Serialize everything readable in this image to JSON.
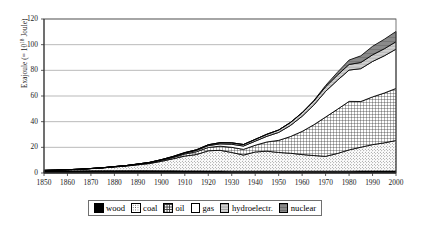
{
  "chart_data": {
    "type": "area",
    "stacked": true,
    "title": "",
    "subtitle": "",
    "xlabel": "",
    "ylabel": "Exajoule (= 10^18 Joule)",
    "ylabel_prefix": "Exajoule (= 10",
    "ylabel_exponent": "18",
    "ylabel_suffix": " Joule)",
    "xlim": [
      1850,
      2000
    ],
    "ylim": [
      0,
      120
    ],
    "ytick_step": 20,
    "xtick_step": 10,
    "grid": "horizontal",
    "legend_position": "bottom-center",
    "yticks": [
      "0",
      "20",
      "40",
      "60",
      "80",
      "100",
      "120"
    ],
    "xticks": [
      "1850",
      "1860",
      "1870",
      "1880",
      "1890",
      "1900",
      "1910",
      "1920",
      "1930",
      "1940",
      "1950",
      "1960",
      "1970",
      "1980",
      "1990",
      "2000"
    ],
    "x": [
      1850,
      1855,
      1860,
      1865,
      1870,
      1875,
      1880,
      1885,
      1890,
      1895,
      1900,
      1905,
      1910,
      1915,
      1920,
      1925,
      1930,
      1935,
      1940,
      1945,
      1950,
      1955,
      1960,
      1965,
      1970,
      1975,
      1980,
      1985,
      1990,
      1995,
      2000
    ],
    "series": [
      {
        "name": "wood",
        "pattern": "solid-black",
        "color": "#000000",
        "values": [
          1.6,
          1.6,
          1.7,
          1.7,
          1.8,
          1.8,
          1.8,
          1.8,
          1.8,
          1.8,
          1.7,
          1.7,
          1.6,
          1.6,
          1.5,
          1.5,
          1.4,
          1.4,
          1.4,
          1.4,
          1.4,
          1.4,
          1.4,
          1.4,
          1.4,
          1.4,
          1.4,
          1.5,
          1.5,
          1.5,
          1.5
        ]
      },
      {
        "name": "coal",
        "pattern": "stipple",
        "color": "#d9d9d9",
        "values": [
          0.4,
          0.6,
          0.9,
          1.2,
          1.6,
          2.2,
          2.9,
          3.6,
          4.6,
          5.6,
          7.4,
          9.4,
          11.6,
          12.8,
          15.8,
          16.2,
          14.6,
          12.6,
          15.0,
          15.6,
          14.6,
          14.0,
          13.0,
          12.2,
          11.6,
          13.8,
          16.6,
          18.6,
          20.6,
          22.0,
          23.8
        ]
      },
      {
        "name": "oil",
        "pattern": "fine-grid",
        "color": "#e8e8e8",
        "values": [
          0.0,
          0.0,
          0.0,
          0.0,
          0.1,
          0.1,
          0.2,
          0.3,
          0.4,
          0.5,
          0.7,
          1.0,
          1.6,
          2.2,
          2.6,
          3.2,
          4.0,
          4.4,
          5.2,
          7.2,
          9.4,
          13.0,
          18.0,
          24.0,
          30.6,
          34.4,
          37.8,
          35.6,
          37.2,
          38.8,
          40.6
        ]
      },
      {
        "name": "gas",
        "pattern": "white",
        "color": "#ffffff",
        "values": [
          0.0,
          0.0,
          0.0,
          0.0,
          0.0,
          0.0,
          0.1,
          0.1,
          0.2,
          0.3,
          0.4,
          0.5,
          0.7,
          1.0,
          1.4,
          1.8,
          2.4,
          2.6,
          3.2,
          4.4,
          6.2,
          8.6,
          11.8,
          15.4,
          20.0,
          22.6,
          24.4,
          25.6,
          27.6,
          29.0,
          30.6
        ]
      },
      {
        "name": "hydroelectr.",
        "pattern": "light-gray",
        "color": "#cccccc",
        "values": [
          0.0,
          0.0,
          0.0,
          0.0,
          0.0,
          0.0,
          0.0,
          0.0,
          0.0,
          0.1,
          0.2,
          0.3,
          0.4,
          0.5,
          0.7,
          0.9,
          1.1,
          1.2,
          1.4,
          1.6,
          1.9,
          2.3,
          2.7,
          3.1,
          3.6,
          4.0,
          4.4,
          4.8,
          5.2,
          5.5,
          5.8
        ]
      },
      {
        "name": "nuclear",
        "pattern": "dark-gray",
        "color": "#808080",
        "values": [
          0.0,
          0.0,
          0.0,
          0.0,
          0.0,
          0.0,
          0.0,
          0.0,
          0.0,
          0.0,
          0.0,
          0.0,
          0.0,
          0.0,
          0.0,
          0.0,
          0.0,
          0.0,
          0.0,
          0.0,
          0.0,
          0.1,
          0.2,
          0.4,
          1.0,
          2.2,
          3.4,
          5.2,
          6.6,
          7.4,
          8.0
        ]
      }
    ]
  },
  "legend": {
    "items": [
      {
        "label": "wood",
        "swatch": "swatch-wood"
      },
      {
        "label": "coal",
        "swatch": "swatch-coal"
      },
      {
        "label": "oil",
        "swatch": "swatch-oil"
      },
      {
        "label": "gas",
        "swatch": "swatch-gas"
      },
      {
        "label": "hydroelectr.",
        "swatch": "swatch-hydroelectr"
      },
      {
        "label": "nuclear",
        "swatch": "swatch-nuclear"
      }
    ]
  }
}
